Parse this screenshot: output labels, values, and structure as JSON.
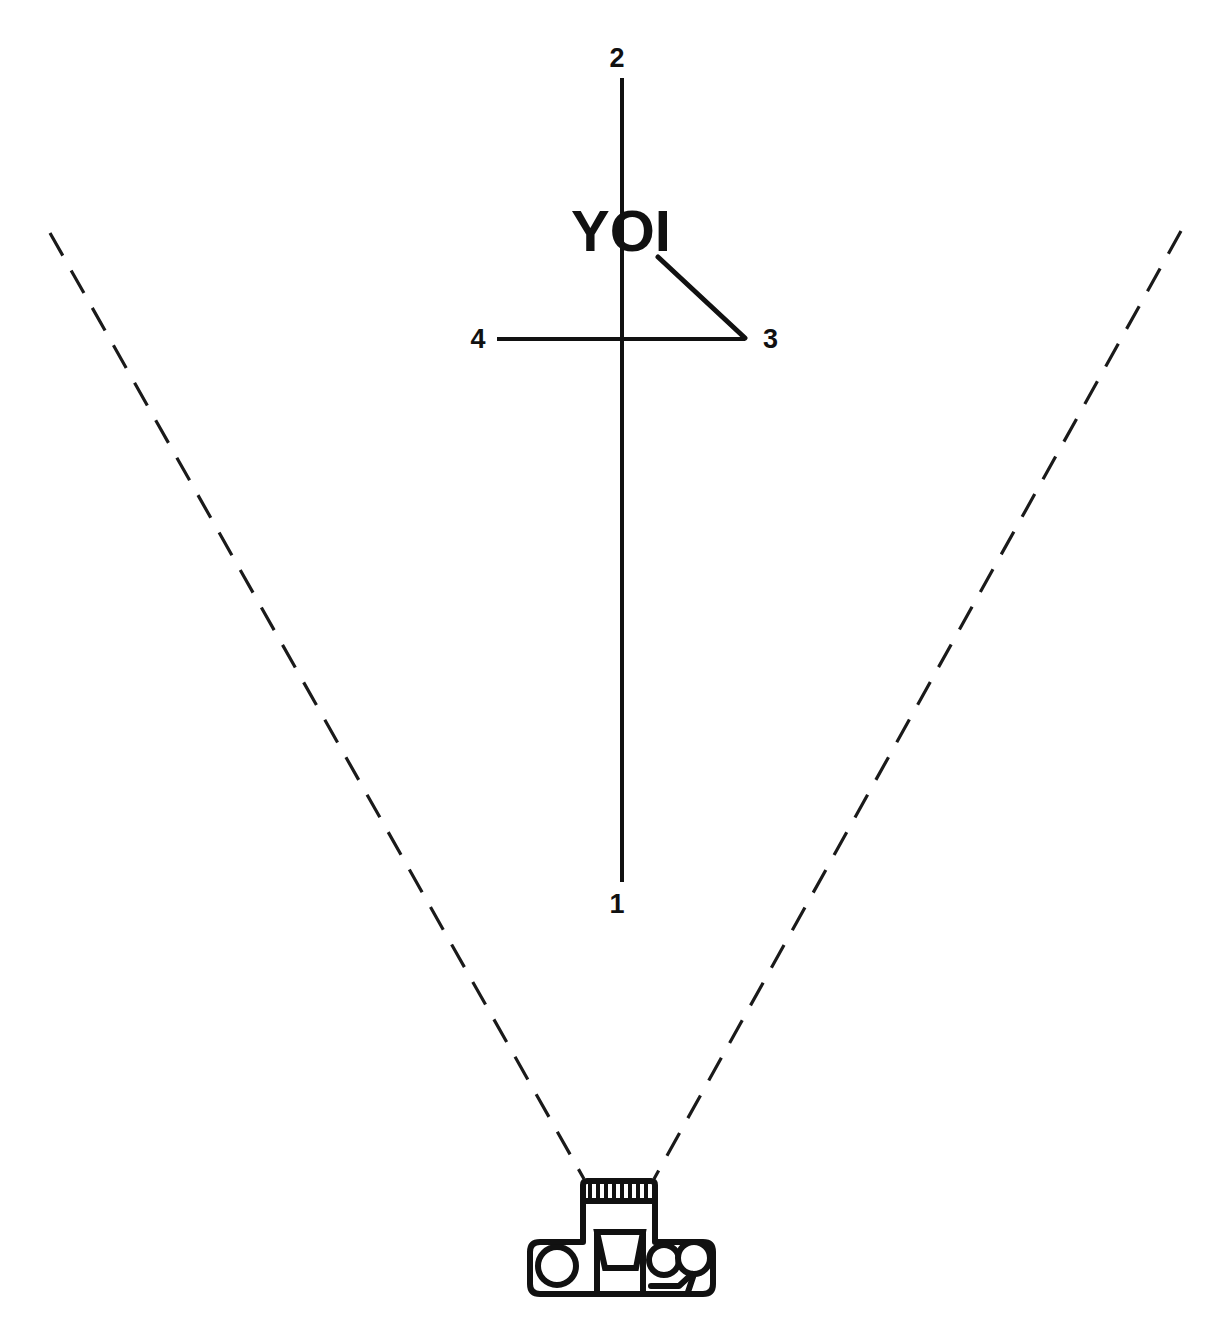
{
  "figure": {
    "title": "YOI",
    "background_color": "#ffffff",
    "line_color": "#111111",
    "labels": {
      "top": "2",
      "bottom": "1",
      "left": "4",
      "right": "3",
      "center_text": "YOI"
    },
    "callouts": [
      {
        "id": "1",
        "text": "1",
        "x": 617,
        "y": 913,
        "role": "bottom-axis-endpoint"
      },
      {
        "id": "2",
        "text": "2",
        "x": 617,
        "y": 67,
        "role": "top-axis-endpoint"
      },
      {
        "id": "3",
        "text": "3",
        "x": 763,
        "y": 348,
        "role": "right-pointer-endpoint"
      },
      {
        "id": "4",
        "text": "4",
        "x": 478,
        "y": 348,
        "role": "left-axis-endpoint"
      }
    ],
    "axes": {
      "vertical": {
        "x": 622,
        "y_top": 78,
        "y_bottom": 882
      },
      "horizontal": {
        "y": 339,
        "x_left": 497,
        "x_right": 745
      },
      "diagonal": {
        "x1": 658,
        "y1": 257,
        "x2": 745,
        "y2": 338
      }
    },
    "field_of_view": {
      "left_ray": {
        "x1": 50,
        "y1": 233,
        "x2": 584,
        "y2": 1179
      },
      "right_ray": {
        "x1": 1181,
        "y1": 231,
        "x2": 654,
        "y2": 1179
      },
      "style": "dashed"
    },
    "camera": {
      "name": "camera-top-view",
      "lens": {
        "x": 583,
        "y": 1180,
        "width": 72,
        "height": 21,
        "ribs": 9
      },
      "body": {
        "x": 530,
        "y": 1201,
        "width": 183,
        "height": 93
      },
      "viewfinder": {
        "x": 597,
        "y": 1232,
        "width": 46,
        "height": 62
      },
      "shutter_knob": {
        "cx": 557,
        "cy": 1264,
        "r": 19
      },
      "rewind_knob": {
        "cx": 664,
        "cy": 1259,
        "r": 15
      },
      "wind_lever_knob": {
        "cx": 693,
        "cy": 1257,
        "r": 15
      }
    }
  }
}
